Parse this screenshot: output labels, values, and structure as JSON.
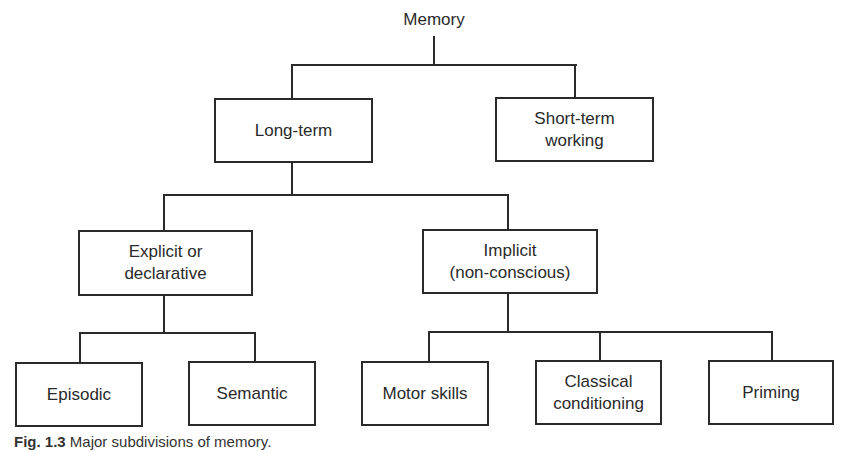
{
  "diagram": {
    "type": "tree",
    "root": {
      "label": "Memory"
    },
    "level1": [
      {
        "id": "long-term",
        "lines": [
          "Long-term"
        ]
      },
      {
        "id": "short-term-working",
        "lines": [
          "Short-term",
          "working"
        ]
      }
    ],
    "level2": [
      {
        "id": "explicit",
        "parent": "long-term",
        "lines": [
          "Explicit or",
          "declarative"
        ]
      },
      {
        "id": "implicit",
        "parent": "long-term",
        "lines": [
          "Implicit",
          "(non-conscious)"
        ]
      }
    ],
    "level3": [
      {
        "id": "episodic",
        "parent": "explicit",
        "lines": [
          "Episodic"
        ]
      },
      {
        "id": "semantic",
        "parent": "explicit",
        "lines": [
          "Semantic"
        ]
      },
      {
        "id": "motor-skills",
        "parent": "implicit",
        "lines": [
          "Motor skills"
        ]
      },
      {
        "id": "classical-conditioning",
        "parent": "implicit",
        "lines": [
          "Classical",
          "conditioning"
        ]
      },
      {
        "id": "priming",
        "parent": "implicit",
        "lines": [
          "Priming"
        ]
      }
    ]
  },
  "caption": {
    "number": "Fig. 1.3",
    "text": "Major subdivisions of memory."
  },
  "colors": {
    "line": "#2a2a2a",
    "text": "#2a2a2a",
    "background": "#ffffff"
  }
}
